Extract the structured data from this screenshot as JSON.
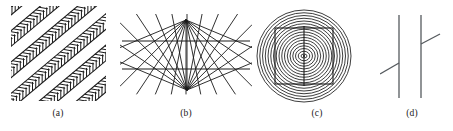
{
  "figure": {
    "background_color": "#ffffff",
    "ink_color": "#1a1a1a",
    "width": 453,
    "height": 131,
    "panel_count": 4
  },
  "captions": {
    "a": "(a)",
    "b": "(b)",
    "c": "(c)",
    "d": "(d)"
  },
  "panels": [
    {
      "id": "a",
      "label": "(a)",
      "illusion_name": "Zollner illusion",
      "description": "Parallel diagonal lines crossed by short oblique hatch marks that alternate direction, making the long lines appear non-parallel.",
      "geometry": {
        "box": {
          "x": 0,
          "y": 0,
          "width": 95,
          "height": 95
        },
        "main_line_count": 8,
        "main_line_angle_deg": -40,
        "hatch_angle_deg": 50,
        "hatch_length": 9,
        "hatch_spacing": 4.2,
        "main_line_spacing": 12,
        "stroke_width": 1.1,
        "hatch_stroke_width": 1.0
      }
    },
    {
      "id": "b",
      "label": "(b)",
      "illusion_name": "Hering illusion",
      "description": "Two straight horizontal lines across a radiating fan of lines converging on two vertices; the horizontals appear bowed.",
      "geometry": {
        "box": {
          "x": 0,
          "y": 0,
          "width": 132,
          "height": 80
        },
        "top_vertex": {
          "x": 66,
          "y": 6
        },
        "bottom_vertex": {
          "x": 67,
          "y": 76
        },
        "ray_count": 13,
        "horizontal_lines": [
          {
            "y": 27,
            "x1": 2,
            "x2": 130
          },
          {
            "y": 55,
            "x1": 2,
            "x2": 130
          }
        ],
        "stroke_width": 0.9
      }
    },
    {
      "id": "c",
      "label": "(c)",
      "illusion_name": "Ehrenstein / Orbison illusion",
      "description": "A square and a vertical line superimposed on a set of concentric circles; the square's sides appear to bulge inward.",
      "geometry": {
        "box": {
          "x": 0,
          "y": 0,
          "width": 100,
          "height": 98
        },
        "center": {
          "x": 51,
          "y": 50
        },
        "circle_count": 17,
        "outer_radius_x": 47,
        "outer_radius_y": 46,
        "radius_step": 2.75,
        "square": {
          "x": 22,
          "y": 22,
          "width": 58,
          "height": 56
        },
        "vertical_line": {
          "x": 51,
          "y1": 20,
          "y2": 80
        },
        "stroke_width": 0.85,
        "square_stroke_width": 1.1
      }
    },
    {
      "id": "d",
      "label": "(d)",
      "illusion_name": "Poggendorff illusion",
      "description": "An oblique line interrupted by two parallel vertical lines; the two visible segments appear misaligned.",
      "geometry": {
        "box": {
          "x": 0,
          "y": 0,
          "width": 62,
          "height": 88
        },
        "vertical_lines": [
          {
            "x": 19,
            "y1": 3,
            "y2": 86
          },
          {
            "x": 41,
            "y1": 3,
            "y2": 86
          }
        ],
        "oblique_segments": [
          {
            "x1": 0,
            "y1": 62,
            "x2": 19,
            "y2": 51
          },
          {
            "x1": 41,
            "y1": 32,
            "x2": 60,
            "y2": 22
          }
        ],
        "oblique_angle_deg": -30,
        "stroke_width": 1.3
      }
    }
  ]
}
